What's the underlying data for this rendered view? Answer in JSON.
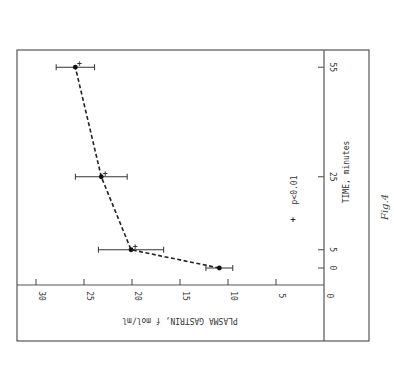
{
  "figure": {
    "caption": "Fig.4",
    "rotation_deg": 90
  },
  "chart_data": {
    "type": "line",
    "title": "",
    "xlabel": "TIME, minutes",
    "ylabel": "PLASMA GASTRIN, f mol/ml",
    "x_ticks": [
      0,
      5,
      25,
      55
    ],
    "y_ticks": [
      0,
      5,
      10,
      15,
      20,
      25,
      30
    ],
    "ylim": [
      0,
      30
    ],
    "grid": false,
    "line_style": "dashed",
    "series": [
      {
        "name": "Plasma gastrin",
        "x": [
          0,
          5,
          25,
          55
        ],
        "values": [
          10.9,
          20.1,
          23.2,
          25.9
        ],
        "error": [
          1.4,
          3.4,
          2.7,
          2.0
        ],
        "significant": [
          false,
          true,
          true,
          true
        ]
      }
    ],
    "legend": {
      "symbol": "+",
      "label": "p<0.01"
    },
    "annotations": [
      "+ marks points with p<0.01"
    ]
  }
}
